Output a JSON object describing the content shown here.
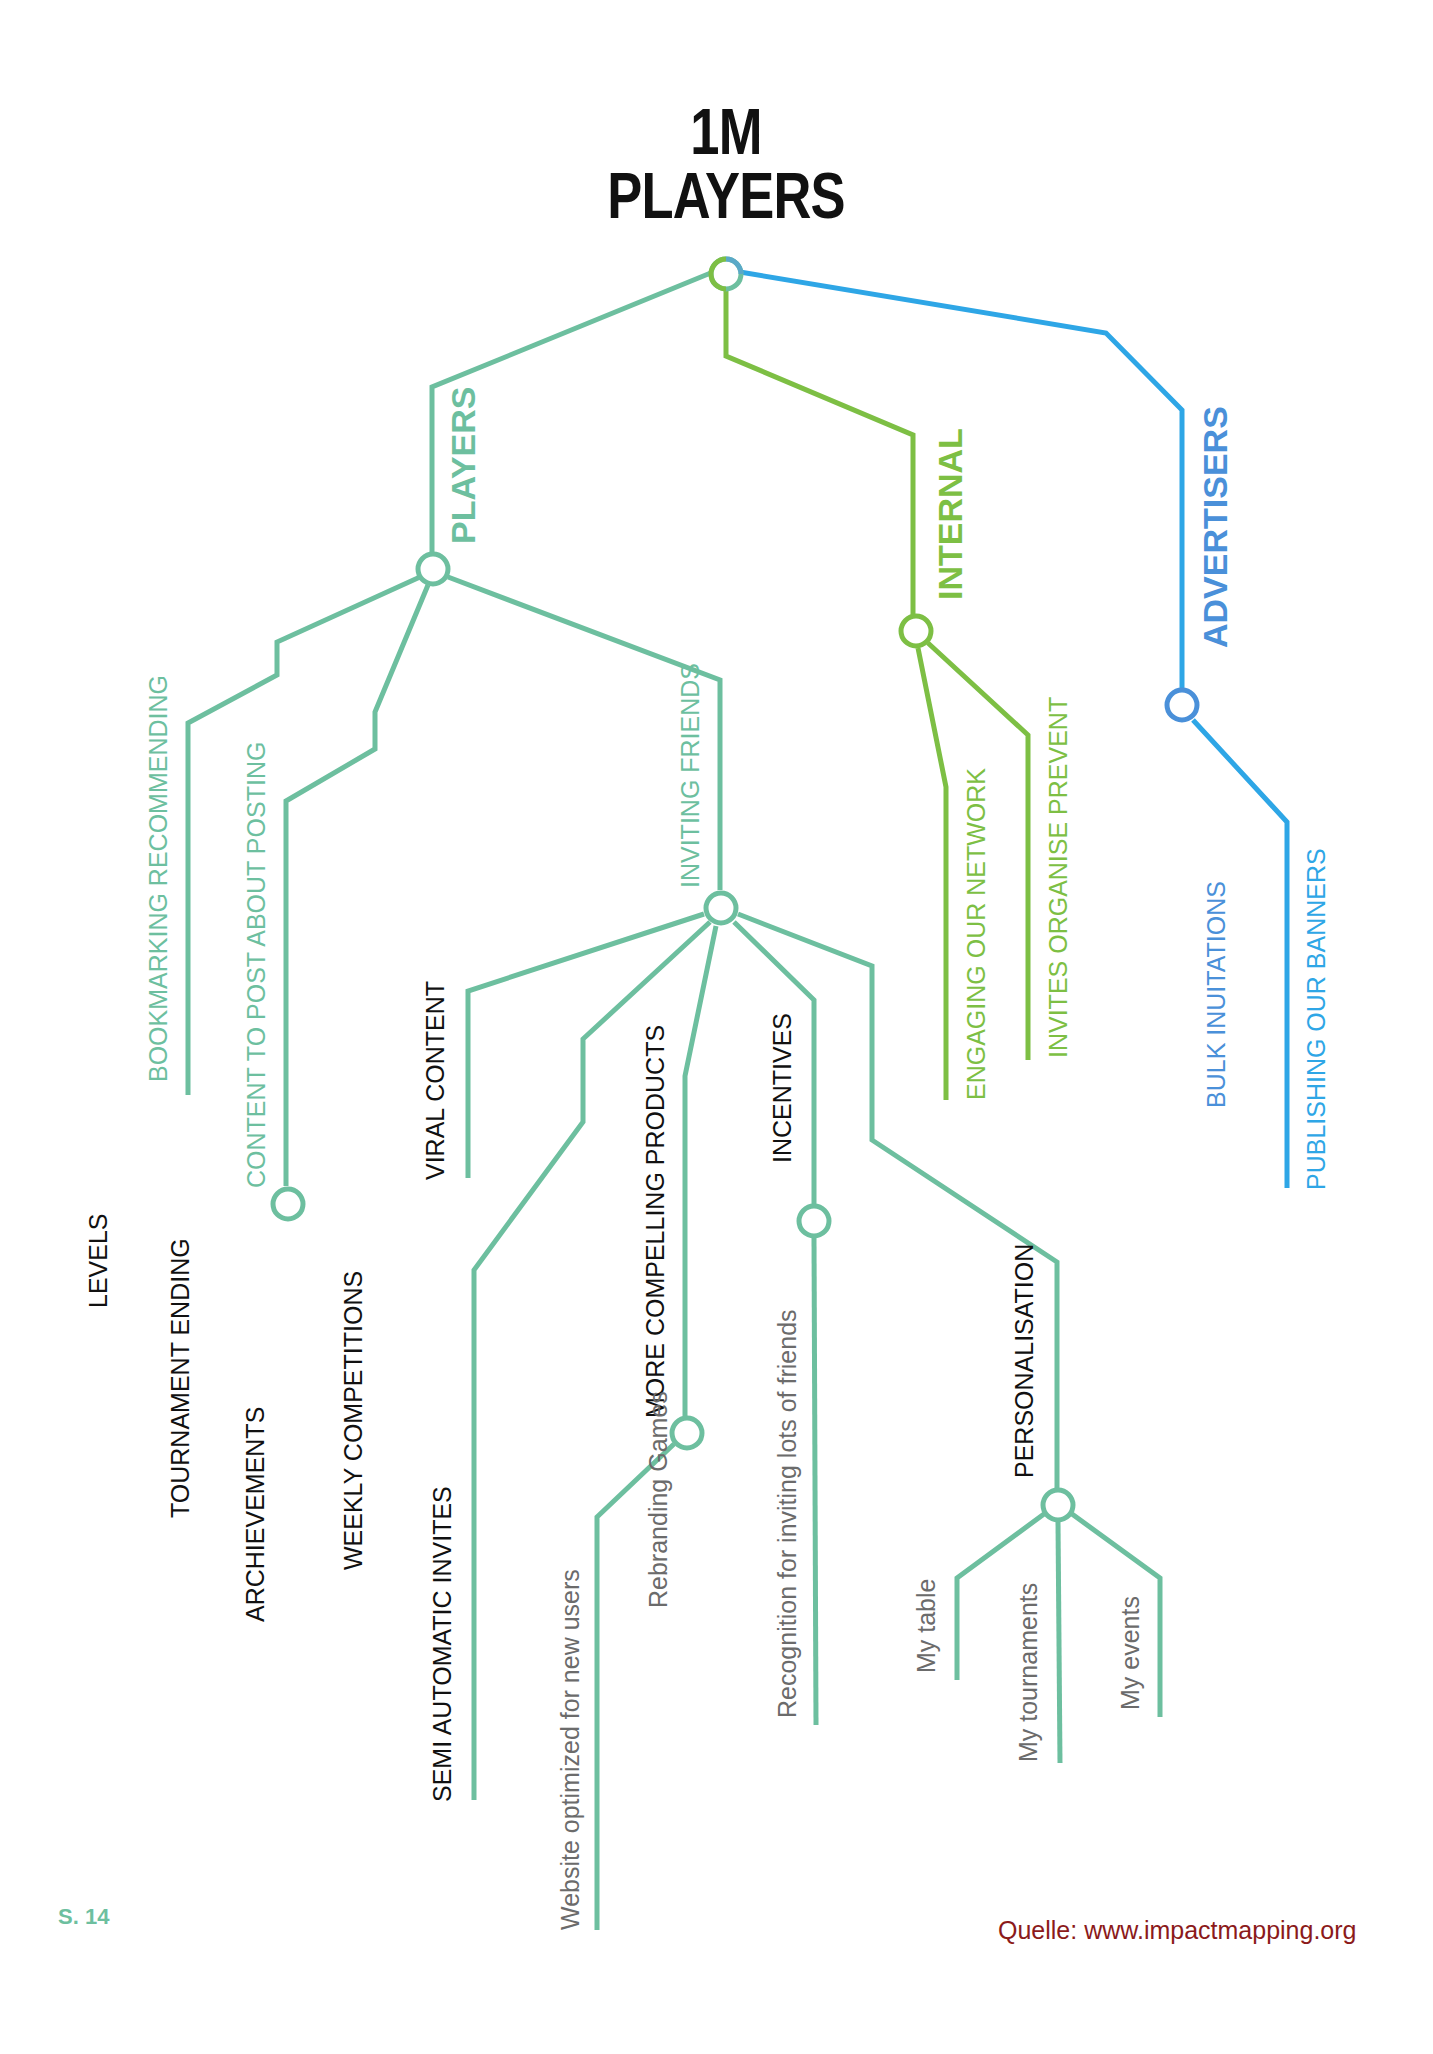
{
  "title": {
    "line1": "1M",
    "line2": "PLAYERS"
  },
  "colors": {
    "players": "#6dbf9f",
    "internal": "#7dbf44",
    "advertisers": "#2ea6e6",
    "text_dark": "#111111",
    "text_gray": "#6b6b6b",
    "source": "#8b1a1a"
  },
  "actors": {
    "players": "PLAYERS",
    "internal": "INTERNAL",
    "advertisers": "ADVERTISERS"
  },
  "impacts": {
    "bookmarking": "BOOKMARKING RECOMMENDING",
    "content_posting": "CONTENT TO POST ABOUT POSTING",
    "inviting_friends": "INVITING FRIENDS",
    "engaging_network": "ENGAGING OUR NETWORK",
    "invites_organise": "INVITES ORGANISE PREVENT",
    "bulk_invitations": "BULK INUITATIONS",
    "publishing_banners": "PUBLISHING OUR BANNERS"
  },
  "deliverables": {
    "viral_content": "VIRAL CONTENT",
    "semi_automatic": "SEMI AUTOMATIC INVITES",
    "more_compelling": "MORE COMPELLING PRODUCTS",
    "incentives": "INCENTIVES",
    "personalisation": "PERSONALISATION",
    "levels": "LEVELS",
    "tournament_ending": "TOURNAMENT ENDING",
    "archievements": "ARCHIEVEMENTS",
    "weekly_competitions": "WEEKLY COMPETITIONS"
  },
  "details": {
    "website_optimized": "Website optimized for new users",
    "rebranding_games": "Rebranding Games",
    "recognition": "Recognition for inviting lots of friends",
    "my_table": "My table",
    "my_tournaments": "My tournaments",
    "my_events": "My events"
  },
  "footer": {
    "page": "S. 14",
    "source": "Quelle:  www.impactmapping.org"
  }
}
